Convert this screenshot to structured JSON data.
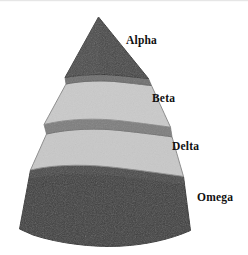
{
  "diagram": {
    "type": "pyramid",
    "title": "",
    "background_color": "#ffffff",
    "tiers": [
      {
        "id": "alpha",
        "label": "Alpha",
        "level": 1,
        "fill_color": "#474747",
        "edge_color": "#2e2e2e",
        "band_color": "#6b6b6b",
        "shape": "apex-triangle"
      },
      {
        "id": "beta",
        "label": "Beta",
        "level": 2,
        "fill_color": "#cacaca",
        "edge_color": "#8a8a8a",
        "band_color": "#7d7d7d",
        "shape": "trapezoid"
      },
      {
        "id": "delta",
        "label": "Delta",
        "level": 3,
        "fill_color": "#c8c8c8",
        "edge_color": "#8a8a8a",
        "band_color": "#7d7d7d",
        "shape": "trapezoid"
      },
      {
        "id": "omega",
        "label": "Omega",
        "level": 4,
        "fill_color": "#3e3e3e",
        "edge_color": "#2a2a2a",
        "band_color": "#5a5a5a",
        "shape": "base-trapezoid"
      }
    ]
  }
}
